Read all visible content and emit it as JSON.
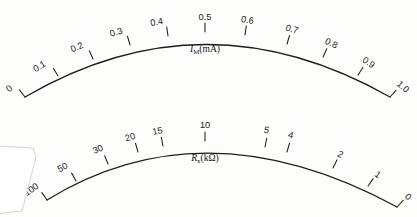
{
  "figure": {
    "background_color": "#fdfdfc",
    "ink_color": "#1c1c1c",
    "width": 417,
    "height": 217
  },
  "scales": [
    {
      "id": "current-scale",
      "name_main": "I",
      "name_sub": "M",
      "name_unit": "(mA)",
      "label_full": "I_M (mA)",
      "direction": "left-to-right increasing",
      "min": "0",
      "max": "1.0",
      "ticks": [
        {
          "label": "0",
          "x": 25,
          "y": 97,
          "angle": -38,
          "lx": 11,
          "ly": 91
        },
        {
          "label": "0.1",
          "x": 58,
          "y": 76,
          "angle": -31,
          "lx": 41,
          "ly": 69
        },
        {
          "label": "0.2",
          "x": 93,
          "y": 59,
          "angle": -24,
          "lx": 78,
          "ly": 50
        },
        {
          "label": "0.3",
          "x": 130,
          "y": 45,
          "angle": -16,
          "lx": 117,
          "ly": 35
        },
        {
          "label": "0.4",
          "x": 168,
          "y": 36,
          "angle": -8,
          "lx": 157,
          "ly": 25
        },
        {
          "label": "0.5",
          "x": 205,
          "y": 32,
          "angle": 0,
          "lx": 205,
          "ly": 20
        },
        {
          "label": "0.6",
          "x": 245,
          "y": 35,
          "angle": 8,
          "lx": 247,
          "ly": 23
        },
        {
          "label": "0.7",
          "x": 287,
          "y": 44,
          "angle": 17,
          "lx": 291,
          "ly": 32
        },
        {
          "label": "0.8",
          "x": 323,
          "y": 57,
          "angle": 25,
          "lx": 330,
          "ly": 46
        },
        {
          "label": "0.9",
          "x": 358,
          "y": 75,
          "angle": 33,
          "lx": 367,
          "ly": 65
        },
        {
          "label": "1.0",
          "x": 390,
          "y": 97,
          "angle": 42,
          "lx": 401,
          "ly": 89
        }
      ]
    },
    {
      "id": "resistance-scale",
      "name_main": "R",
      "name_sub": "x",
      "name_unit": "(kΩ)",
      "label_full": "R_x (kΩ)",
      "direction": "left-to-right decreasing",
      "min": "0",
      "max": "100",
      "ticks": [
        {
          "label": "100",
          "x": 47,
          "y": 200,
          "angle": -35,
          "lx": 33,
          "ly": 192
        },
        {
          "label": "50",
          "x": 76,
          "y": 181,
          "angle": -29,
          "lx": 64,
          "ly": 170
        },
        {
          "label": "30",
          "x": 108,
          "y": 164,
          "angle": -22,
          "lx": 99,
          "ly": 152
        },
        {
          "label": "20",
          "x": 138,
          "y": 152,
          "angle": -16,
          "lx": 131,
          "ly": 140
        },
        {
          "label": "15",
          "x": 163,
          "y": 146,
          "angle": -11,
          "lx": 158,
          "ly": 134
        },
        {
          "label": "10",
          "x": 205,
          "y": 141,
          "angle": 0,
          "lx": 205,
          "ly": 128
        },
        {
          "label": "5",
          "x": 265,
          "y": 147,
          "angle": 11,
          "lx": 266,
          "ly": 133
        },
        {
          "label": "4",
          "x": 287,
          "y": 152,
          "angle": 16,
          "lx": 290,
          "ly": 138
        },
        {
          "label": "2",
          "x": 333,
          "y": 168,
          "angle": 26,
          "lx": 339,
          "ly": 157
        },
        {
          "label": "1",
          "x": 368,
          "y": 186,
          "angle": 35,
          "lx": 376,
          "ly": 177
        },
        {
          "label": "0",
          "x": 397,
          "y": 207,
          "angle": 43,
          "lx": 406,
          "ly": 199
        }
      ]
    }
  ],
  "artifacts": {
    "page_corner": "white torn page corner at lower-left"
  }
}
